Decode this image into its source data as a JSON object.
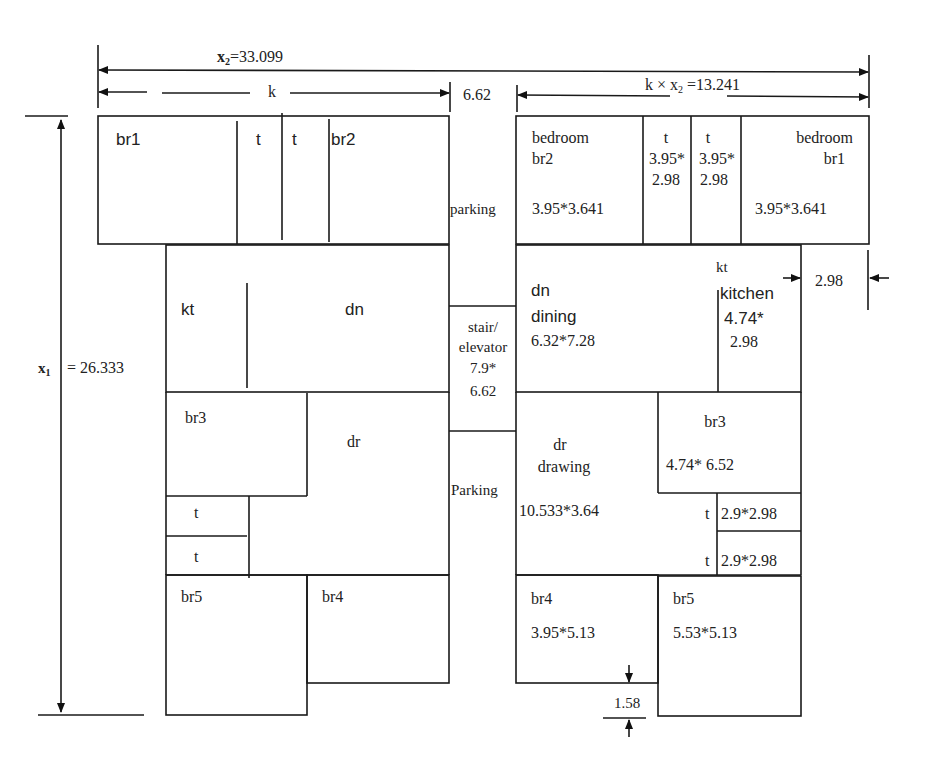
{
  "dimensions": {
    "x2": {
      "var": "x",
      "sub": "2",
      "value": "=33.099"
    },
    "k": "k",
    "gap": "6.62",
    "kx2": {
      "prefix": "k × x",
      "sub": "2",
      "value": "=13.241"
    },
    "x1": {
      "var": "x",
      "sub": "1",
      "value": "= 26.333"
    },
    "kitchen_width": "2.98",
    "br4_offset": "1.58"
  },
  "left_plan": {
    "br1": "br1",
    "t1": "t",
    "t2": "t",
    "br2": "br2",
    "kt": "kt",
    "dn": "dn",
    "br3": "br3",
    "dr": "dr",
    "t3": "t",
    "t4": "t",
    "br5": "br5",
    "br4": "br4"
  },
  "middle": {
    "parking_top": "parking",
    "stair_l1": "stair/",
    "stair_l2": "elevator",
    "stair_l3": "7.9*",
    "stair_l4": "6.62",
    "parking_bottom": "Parking"
  },
  "right_plan": {
    "br2": {
      "l1": "bedroom",
      "l2": "br2",
      "size": "3.95*3.641"
    },
    "t1": {
      "l1": "t",
      "l2": "3.95*",
      "l3": "2.98"
    },
    "t2": {
      "l1": "t",
      "l2": "3.95*",
      "l3": "2.98"
    },
    "br1": {
      "l1": "bedroom",
      "l2": "br1",
      "size": "3.95*3.641"
    },
    "dn": {
      "l1": "dn",
      "l2": "dining",
      "size": "6.32*7.28"
    },
    "kt": {
      "l1": "kt",
      "l2": "kitchen",
      "l3": "4.74*",
      "l4": "2.98"
    },
    "dr": {
      "l1": "dr",
      "l2": "drawing",
      "size": "10.533*3.64"
    },
    "br3": {
      "l1": "br3",
      "size": "4.74* 6.52"
    },
    "t3": {
      "label": "t",
      "size": "2.9*2.98"
    },
    "t4": {
      "label": "t",
      "size": "2.9*2.98"
    },
    "br4": {
      "l1": "br4",
      "size": "3.95*5.13"
    },
    "br5": {
      "l1": "br5",
      "size": "5.53*5.13"
    }
  }
}
